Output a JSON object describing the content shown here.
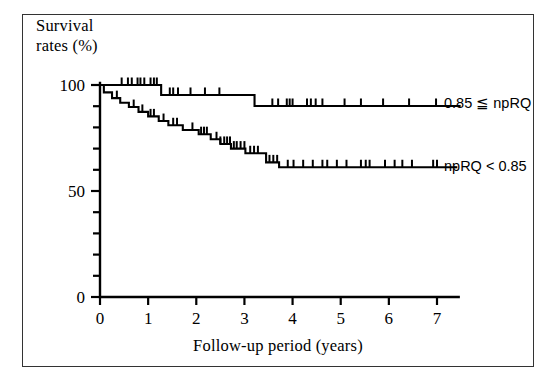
{
  "figure": {
    "border_color": "#333333",
    "background": "#ffffff",
    "line_color": "#000000"
  },
  "axes": {
    "y_title_line1": "Survival",
    "y_title_line2": "rates (%)",
    "x_title": "Follow-up period (years)",
    "y_tick_labels": [
      "100",
      "50",
      "0"
    ],
    "y_tick_values": [
      100,
      50,
      0
    ],
    "x_tick_labels": [
      "0",
      "1",
      "2",
      "3",
      "4",
      "5",
      "6",
      "7"
    ],
    "x_tick_values": [
      0,
      1,
      2,
      3,
      4,
      5,
      6,
      7
    ]
  },
  "legend": {
    "upper_label": "0.85 ≦ npRQ",
    "lower_label": "npRQ < 0.85"
  },
  "chart_data": {
    "type": "line",
    "subtype": "kaplan-meier-survival",
    "title": "",
    "xlabel": "Follow-up period (years)",
    "ylabel": "Survival rates (%)",
    "xlim": [
      0,
      7.45
    ],
    "ylim": [
      0,
      100
    ],
    "y_major_ticks": [
      0,
      50,
      100
    ],
    "y_minor_tick_interval": 10,
    "x_major_ticks": [
      0,
      1,
      2,
      3,
      4,
      5,
      6,
      7
    ],
    "grid": false,
    "legend_position": "right-inline",
    "series": [
      {
        "name": "0.85 ≦ npRQ",
        "legend_label": "0.85 ≦ npRQ",
        "steps": [
          [
            0.0,
            100.0
          ],
          [
            1.27,
            100.0
          ],
          [
            1.27,
            95.3
          ],
          [
            3.21,
            95.3
          ],
          [
            3.21,
            90.1
          ],
          [
            7.45,
            90.1
          ]
        ],
        "censor_marks": [
          0.45,
          0.58,
          0.66,
          0.78,
          0.84,
          0.92,
          1.05,
          1.12,
          1.18,
          1.45,
          1.52,
          1.62,
          1.88,
          2.18,
          2.48,
          3.58,
          3.7,
          3.88,
          3.94,
          4.0,
          4.3,
          4.38,
          4.48,
          4.62,
          5.08,
          5.42,
          5.88,
          6.42,
          6.98
        ],
        "final_value": 90.1
      },
      {
        "name": "npRQ < 0.85",
        "legend_label": "npRQ < 0.85",
        "steps": [
          [
            0.0,
            100.0
          ],
          [
            0.08,
            100.0
          ],
          [
            0.08,
            96.5
          ],
          [
            0.25,
            96.5
          ],
          [
            0.25,
            93.8
          ],
          [
            0.42,
            93.8
          ],
          [
            0.42,
            91.6
          ],
          [
            0.6,
            91.6
          ],
          [
            0.6,
            89.6
          ],
          [
            0.8,
            89.6
          ],
          [
            0.8,
            87.3
          ],
          [
            1.0,
            87.3
          ],
          [
            1.0,
            85.2
          ],
          [
            1.22,
            85.2
          ],
          [
            1.22,
            83.0
          ],
          [
            1.42,
            83.0
          ],
          [
            1.42,
            81.0
          ],
          [
            1.72,
            81.0
          ],
          [
            1.72,
            78.8
          ],
          [
            2.05,
            78.8
          ],
          [
            2.05,
            76.8
          ],
          [
            2.3,
            76.8
          ],
          [
            2.3,
            74.4
          ],
          [
            2.5,
            74.4
          ],
          [
            2.5,
            72.2
          ],
          [
            2.72,
            72.2
          ],
          [
            2.72,
            70.0
          ],
          [
            3.02,
            70.0
          ],
          [
            3.02,
            67.8
          ],
          [
            3.45,
            67.8
          ],
          [
            3.45,
            63.5
          ],
          [
            3.72,
            63.5
          ],
          [
            3.72,
            61.2
          ],
          [
            7.38,
            61.2
          ]
        ],
        "censor_marks": [
          0.35,
          0.7,
          0.88,
          1.05,
          1.12,
          1.32,
          1.52,
          1.6,
          1.92,
          2.1,
          2.16,
          2.22,
          2.42,
          2.5,
          2.58,
          2.64,
          2.7,
          2.78,
          2.84,
          2.92,
          3.0,
          3.12,
          3.2,
          3.28,
          3.52,
          3.6,
          3.68,
          3.9,
          4.02,
          4.22,
          4.42,
          4.62,
          4.72,
          4.92,
          5.12,
          5.42,
          5.52,
          5.6,
          5.92,
          6.12,
          6.28,
          6.48,
          6.92,
          7.0
        ],
        "final_value": 61.2
      }
    ]
  }
}
